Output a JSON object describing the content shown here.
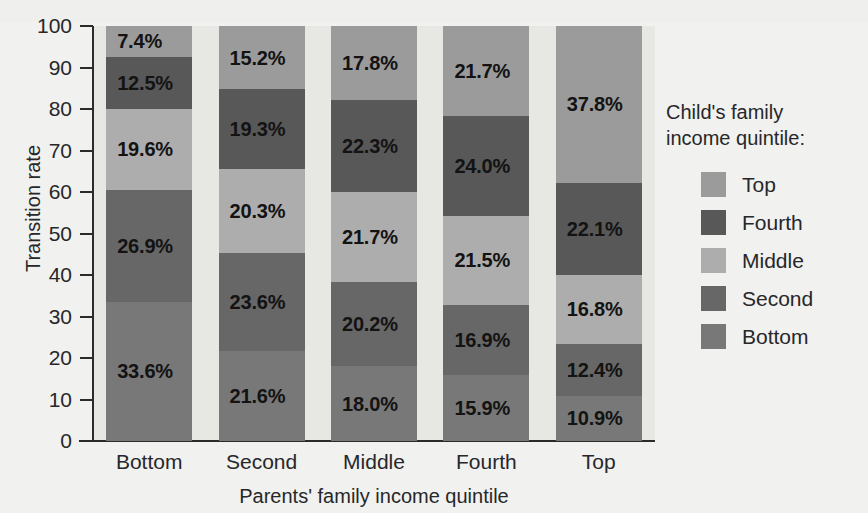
{
  "chart_data": {
    "type": "bar",
    "subtype": "stacked-percentage",
    "title": "",
    "xlabel": "Parents' family income quintile",
    "ylabel": "Transition rate",
    "ylim": [
      0,
      100
    ],
    "yticks": [
      "0",
      "10",
      "20",
      "30",
      "40",
      "50",
      "60",
      "70",
      "80",
      "90",
      "100"
    ],
    "grid": false,
    "legend_position": "right",
    "legend_title": "Child's family\nincome quintile:",
    "categories": [
      "Bottom",
      "Second",
      "Middle",
      "Fourth",
      "Top"
    ],
    "series": [
      {
        "name": "Bottom",
        "color": "#787878",
        "values": [
          33.6,
          21.6,
          18.0,
          15.9,
          10.9
        ],
        "labels": [
          "33.6%",
          "21.6%",
          "18.0%",
          "15.9%",
          "10.9%"
        ]
      },
      {
        "name": "Second",
        "color": "#676767",
        "values": [
          26.9,
          23.6,
          20.2,
          16.9,
          12.4
        ],
        "labels": [
          "26.9%",
          "23.6%",
          "20.2%",
          "16.9%",
          "12.4%"
        ]
      },
      {
        "name": "Middle",
        "color": "#adadad",
        "values": [
          19.6,
          20.3,
          21.7,
          21.5,
          16.8
        ],
        "labels": [
          "19.6%",
          "20.3%",
          "21.7%",
          "21.5%",
          "16.8%"
        ]
      },
      {
        "name": "Fourth",
        "color": "#585858",
        "values": [
          12.5,
          19.3,
          22.3,
          24.0,
          22.1
        ],
        "labels": [
          "12.5%",
          "19.3%",
          "22.3%",
          "24.0%",
          "22.1%"
        ]
      },
      {
        "name": "Top",
        "color": "#9b9b9b",
        "values": [
          7.4,
          15.2,
          17.8,
          21.7,
          37.8
        ],
        "labels": [
          "7.4%",
          "15.2%",
          "17.8%",
          "21.7%",
          "37.8%"
        ]
      }
    ],
    "legend_entries": [
      {
        "label": "Top",
        "color": "#9b9b9b"
      },
      {
        "label": "Fourth",
        "color": "#585858"
      },
      {
        "label": "Middle",
        "color": "#adadad"
      },
      {
        "label": "Second",
        "color": "#676767"
      },
      {
        "label": "Bottom",
        "color": "#787878"
      }
    ],
    "colors": {
      "plot_background": "#e7e7e4",
      "figure_background": "#f1f1ef",
      "axis": "#2b2b2b",
      "text": "#27272a",
      "data_label": "#131313"
    }
  }
}
